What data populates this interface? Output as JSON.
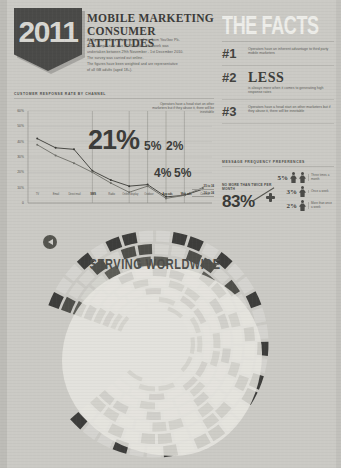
{
  "poster": {
    "year": "2011",
    "title_line1": "MOBILE MARKETING",
    "title_line2": "CONSUMER ATTITUDES",
    "intro": [
      "All figures, unless otherwise stated are from YouGov Plc.",
      "Total sample size was 2188 adults. Fieldwork was",
      "undertaken between 29th November - 1st December 2010.",
      "The survey was carried out online.",
      "The figures have been weighted and are representative",
      "of all GB adults (aged 18+)."
    ]
  },
  "facts": {
    "heading": "THE FACTS",
    "items": [
      {
        "number": "#1",
        "big": "",
        "text": "Operators have an inherent advantage to third party mobile marketers"
      },
      {
        "number": "#2",
        "big": "LESS",
        "text": "is always more when it comes to generating high response rates"
      },
      {
        "number": "#3",
        "big": "",
        "text": "Operators have a head start on other marketers but if they abuse it, there will be inevitable"
      }
    ]
  },
  "message_frequency": {
    "heading": "MESSAGE FREQUENCY PREFERENCES",
    "headline_label": "NO MORE THAN TWICE PER MONTH",
    "headline_value": "83%",
    "rows": [
      {
        "pct": "5%",
        "label": "Three times a month"
      },
      {
        "pct": "3%",
        "label": "Once a week"
      },
      {
        "pct": "2%",
        "label": "More than once a week"
      }
    ]
  },
  "chart_data": {
    "type": "line",
    "title": "CUSTOMER RESPONSE RATE BY CHANNEL",
    "xlabel": "",
    "ylabel": "",
    "ylim": [
      0,
      60
    ],
    "ytick_labels": [
      "60%",
      "50%",
      "40%",
      "30%",
      "20%",
      "10%",
      "0"
    ],
    "grid": true,
    "legend_position": "right",
    "categories": [
      "TV",
      "Email",
      "Direct mail",
      "SMS",
      "Radio",
      "Online display",
      "Outdoor",
      "App ads",
      "Web ads",
      "Cinema"
    ],
    "highlighted_categories": [
      "SMS",
      "App ads",
      "Web ads"
    ],
    "series": [
      {
        "name": "25 to 34",
        "values": [
          42,
          36,
          35,
          21,
          15,
          11,
          12,
          4,
          5,
          9
        ]
      },
      {
        "name": "16 to 24",
        "values": [
          38,
          31,
          26,
          20,
          13,
          7,
          11,
          3,
          5,
          10
        ]
      }
    ],
    "callouts": [
      {
        "category": "SMS",
        "value": "21%"
      },
      {
        "category": "Online display",
        "value": "5%"
      },
      {
        "category": "Outdoor",
        "value": "2%"
      },
      {
        "category": "App ads",
        "value": "4%"
      },
      {
        "category": "Web ads",
        "value": "5%"
      }
    ],
    "note": "Operators have a head start on other marketers but if they abuse it, there will be inevitable"
  },
  "radial": {
    "title": "SERVING WORLDWIDE",
    "play_icon": "play-left-icon"
  }
}
